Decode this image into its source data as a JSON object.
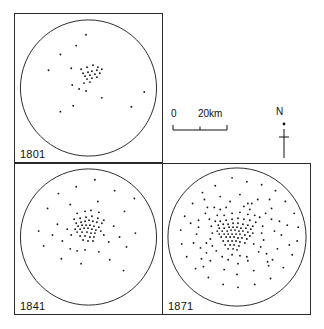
{
  "figure": {
    "panels": [
      {
        "id": "panel-1801",
        "year_label": "1801",
        "circle": {
          "cx": 74.5,
          "cy": 75,
          "r": 69
        },
        "dot_count": 31,
        "dots": [
          [
            72,
            21
          ],
          [
            62,
            32
          ],
          [
            46,
            41
          ],
          [
            34,
            57
          ],
          [
            57,
            55
          ],
          [
            67,
            56
          ],
          [
            73,
            54
          ],
          [
            79,
            52
          ],
          [
            84,
            54
          ],
          [
            69,
            60
          ],
          [
            74,
            59
          ],
          [
            78,
            58
          ],
          [
            83,
            57
          ],
          [
            88,
            56
          ],
          [
            71,
            63
          ],
          [
            76,
            62
          ],
          [
            81,
            61
          ],
          [
            86,
            60
          ],
          [
            73,
            66
          ],
          [
            78,
            65
          ],
          [
            83,
            64
          ],
          [
            70,
            70
          ],
          [
            76,
            69
          ],
          [
            58,
            72
          ],
          [
            65,
            76
          ],
          [
            72,
            78
          ],
          [
            88,
            85
          ],
          [
            59,
            93
          ],
          [
            46,
            99
          ],
          [
            118,
            94
          ],
          [
            131,
            79
          ]
        ]
      },
      {
        "id": "panel-1841",
        "year_label": "1841",
        "circle": {
          "cx": 74.5,
          "cy": 74,
          "r": 69
        },
        "dot_count": 72,
        "dots": [
          [
            81,
            16
          ],
          [
            62,
            23
          ],
          [
            101,
            27
          ],
          [
            44,
            30
          ],
          [
            121,
            35
          ],
          [
            33,
            45
          ],
          [
            56,
            41
          ],
          [
            84,
            38
          ],
          [
            111,
            48
          ],
          [
            63,
            50
          ],
          [
            71,
            48
          ],
          [
            77,
            47
          ],
          [
            85,
            49
          ],
          [
            60,
            56
          ],
          [
            66,
            55
          ],
          [
            72,
            54
          ],
          [
            78,
            53
          ],
          [
            84,
            55
          ],
          [
            90,
            57
          ],
          [
            62,
            60
          ],
          [
            67,
            59
          ],
          [
            71,
            58
          ],
          [
            75,
            57
          ],
          [
            79,
            58
          ],
          [
            83,
            59
          ],
          [
            88,
            60
          ],
          [
            64,
            63
          ],
          [
            68,
            62
          ],
          [
            72,
            62
          ],
          [
            76,
            62
          ],
          [
            80,
            63
          ],
          [
            85,
            64
          ],
          [
            61,
            66
          ],
          [
            66,
            66
          ],
          [
            70,
            65
          ],
          [
            74,
            65
          ],
          [
            78,
            66
          ],
          [
            82,
            67
          ],
          [
            87,
            68
          ],
          [
            63,
            69
          ],
          [
            68,
            69
          ],
          [
            73,
            69
          ],
          [
            77,
            70
          ],
          [
            81,
            70
          ],
          [
            66,
            73
          ],
          [
            71,
            73
          ],
          [
            76,
            74
          ],
          [
            80,
            74
          ],
          [
            69,
            77
          ],
          [
            74,
            78
          ],
          [
            79,
            78
          ],
          [
            57,
            72
          ],
          [
            53,
            66
          ],
          [
            48,
            78
          ],
          [
            90,
            72
          ],
          [
            95,
            79
          ],
          [
            43,
            61
          ],
          [
            38,
            72
          ],
          [
            29,
            83
          ],
          [
            24,
            68
          ],
          [
            100,
            63
          ],
          [
            106,
            74
          ],
          [
            113,
            84
          ],
          [
            122,
            70
          ],
          [
            56,
            86
          ],
          [
            63,
            88
          ],
          [
            71,
            87
          ],
          [
            85,
            89
          ],
          [
            47,
            96
          ],
          [
            67,
            101
          ],
          [
            96,
            97
          ],
          [
            110,
            108
          ]
        ]
      },
      {
        "id": "panel-1871",
        "year_label": "1871",
        "circle": {
          "cx": 75,
          "cy": 74,
          "r": 70
        },
        "dot_count": 152,
        "dots": [
          [
            70,
            14
          ],
          [
            85,
            18
          ],
          [
            53,
            22
          ],
          [
            100,
            21
          ],
          [
            40,
            29
          ],
          [
            114,
            27
          ],
          [
            30,
            40
          ],
          [
            124,
            38
          ],
          [
            22,
            53
          ],
          [
            133,
            50
          ],
          [
            18,
            67
          ],
          [
            137,
            64
          ],
          [
            19,
            81
          ],
          [
            136,
            78
          ],
          [
            24,
            94
          ],
          [
            131,
            92
          ],
          [
            33,
            106
          ],
          [
            122,
            105
          ],
          [
            46,
            115
          ],
          [
            109,
            116
          ],
          [
            61,
            122
          ],
          [
            93,
            122
          ],
          [
            76,
            125
          ],
          [
            58,
            33
          ],
          [
            78,
            31
          ],
          [
            96,
            36
          ],
          [
            45,
            44
          ],
          [
            110,
            45
          ],
          [
            36,
            57
          ],
          [
            118,
            58
          ],
          [
            34,
            71
          ],
          [
            120,
            72
          ],
          [
            38,
            85
          ],
          [
            116,
            86
          ],
          [
            48,
            98
          ],
          [
            106,
            99
          ],
          [
            62,
            107
          ],
          [
            92,
            108
          ],
          [
            75,
            112
          ],
          [
            64,
            44
          ],
          [
            82,
            43
          ],
          [
            55,
            52
          ],
          [
            93,
            52
          ],
          [
            49,
            63
          ],
          [
            101,
            63
          ],
          [
            48,
            76
          ],
          [
            102,
            77
          ],
          [
            54,
            88
          ],
          [
            97,
            89
          ],
          [
            66,
            97
          ],
          [
            86,
            98
          ],
          [
            76,
            101
          ],
          [
            62,
            52
          ],
          [
            70,
            50
          ],
          [
            78,
            49
          ],
          [
            86,
            51
          ],
          [
            58,
            58
          ],
          [
            64,
            57
          ],
          [
            70,
            56
          ],
          [
            76,
            55
          ],
          [
            82,
            56
          ],
          [
            88,
            57
          ],
          [
            94,
            59
          ],
          [
            56,
            62
          ],
          [
            61,
            61
          ],
          [
            66,
            61
          ],
          [
            71,
            60
          ],
          [
            76,
            60
          ],
          [
            81,
            61
          ],
          [
            86,
            62
          ],
          [
            91,
            63
          ],
          [
            57,
            65
          ],
          [
            62,
            65
          ],
          [
            67,
            64
          ],
          [
            71,
            64
          ],
          [
            75,
            64
          ],
          [
            79,
            65
          ],
          [
            84,
            65
          ],
          [
            89,
            66
          ],
          [
            55,
            68
          ],
          [
            60,
            68
          ],
          [
            65,
            68
          ],
          [
            69,
            67
          ],
          [
            73,
            67
          ],
          [
            77,
            68
          ],
          [
            81,
            68
          ],
          [
            86,
            69
          ],
          [
            91,
            70
          ],
          [
            57,
            71
          ],
          [
            62,
            71
          ],
          [
            66,
            71
          ],
          [
            70,
            71
          ],
          [
            74,
            71
          ],
          [
            78,
            71
          ],
          [
            83,
            72
          ],
          [
            88,
            73
          ],
          [
            59,
            74
          ],
          [
            64,
            74
          ],
          [
            68,
            74
          ],
          [
            72,
            74
          ],
          [
            76,
            75
          ],
          [
            80,
            75
          ],
          [
            85,
            76
          ],
          [
            61,
            78
          ],
          [
            66,
            78
          ],
          [
            70,
            78
          ],
          [
            74,
            78
          ],
          [
            78,
            79
          ],
          [
            83,
            80
          ],
          [
            63,
            82
          ],
          [
            68,
            82
          ],
          [
            72,
            82
          ],
          [
            77,
            83
          ],
          [
            66,
            86
          ],
          [
            71,
            86
          ],
          [
            75,
            87
          ],
          [
            53,
            58
          ],
          [
            47,
            56
          ],
          [
            43,
            50
          ],
          [
            98,
            54
          ],
          [
            104,
            50
          ],
          [
            110,
            56
          ],
          [
            50,
            83
          ],
          [
            44,
            90
          ],
          [
            39,
            96
          ],
          [
            99,
            84
          ],
          [
            105,
            91
          ],
          [
            111,
            97
          ],
          [
            70,
            92
          ],
          [
            78,
            93
          ],
          [
            85,
            94
          ],
          [
            60,
            94
          ],
          [
            52,
            44
          ],
          [
            90,
            40
          ],
          [
            36,
            64
          ],
          [
            113,
            68
          ],
          [
            68,
            38
          ],
          [
            58,
            46
          ],
          [
            88,
            46
          ],
          [
            100,
            70
          ],
          [
            50,
            70
          ],
          [
            44,
            80
          ],
          [
            92,
            81
          ],
          [
            86,
            40
          ],
          [
            28,
            60
          ],
          [
            126,
            62
          ],
          [
            31,
            80
          ],
          [
            128,
            82
          ],
          [
            42,
            36
          ],
          [
            108,
            36
          ],
          [
            41,
            104
          ],
          [
            107,
            103
          ]
        ]
      }
    ],
    "legend": {
      "scale": {
        "zero_label": "0",
        "max_label": "20km"
      },
      "north": {
        "letter": "N"
      }
    }
  }
}
